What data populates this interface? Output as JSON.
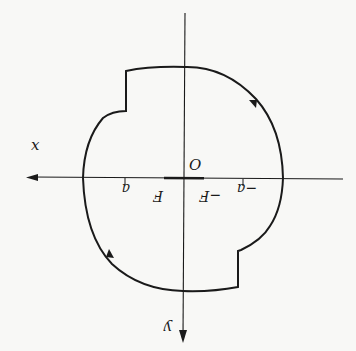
{
  "diagram": {
    "colors": {
      "background": "#f8f8f6",
      "ink": "#1a1a1a"
    },
    "axes": {
      "x_label": "x",
      "y_label": "y",
      "origin_label": "O"
    },
    "ticks": [
      {
        "label": "a",
        "position": "a"
      },
      {
        "label": "F",
        "position": "F"
      },
      {
        "label": "−F",
        "position": "-F"
      },
      {
        "label": "−a",
        "position": "-a"
      }
    ],
    "contour": {
      "type": "closed curve",
      "arrows": [
        "direction-arrow-upper-right",
        "direction-arrow-lower-left"
      ],
      "notches": [
        "upper-left-step",
        "lower-right-step"
      ]
    },
    "thick_segment": "segment on x-axis from F to -F"
  }
}
